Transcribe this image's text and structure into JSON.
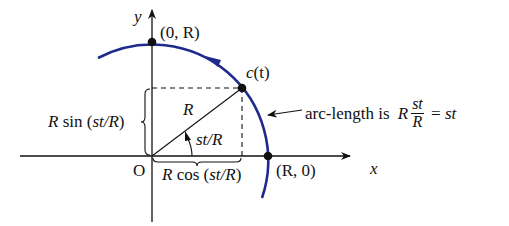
{
  "diagram": {
    "colors": {
      "arc": "#1f2a8c",
      "axes": "#111111",
      "text": "#111111"
    },
    "axes": {
      "x_label": "x",
      "y_label": "y",
      "origin_label": "O"
    },
    "points": [
      {
        "name": "top",
        "label": "(0, R)"
      },
      {
        "name": "moving",
        "label": "c(t)",
        "label_fn": "c",
        "label_arg": "(t)"
      },
      {
        "name": "right",
        "label": "(R, 0)"
      }
    ],
    "labels": {
      "radius": "R",
      "angle": "st/R",
      "vertical_leg": "R sin (st/R)",
      "vertical_leg_R": "R",
      "vertical_leg_rest": " sin (",
      "vertical_leg_arg": "st/R",
      "vertical_leg_close": ")",
      "horizontal_leg_R": "R",
      "horizontal_leg_rest": " cos (",
      "horizontal_leg_arg": "st/R",
      "horizontal_leg_close": ")",
      "annotation_prefix": "arc-length is ",
      "annotation_R": "R",
      "annotation_num": "st",
      "annotation_den": "R",
      "annotation_eq": " = ",
      "annotation_result": "st"
    }
  }
}
